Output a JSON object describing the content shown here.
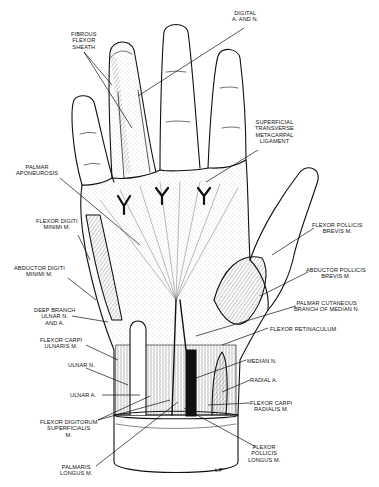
{
  "figure": {
    "signature": "k.P"
  },
  "labels": [
    {
      "id": "digital-a-and-n",
      "text": "DIGITAL\nA. AND N.",
      "x": 238,
      "y": 10,
      "align": "c"
    },
    {
      "id": "fibrous-flexor-sheath",
      "text": "FIBROUS\nFLEXOR\nSHEATH",
      "x": 70,
      "y": 31,
      "align": "c"
    },
    {
      "id": "superficial-transverse-metacarpal-ligament",
      "text": "SUPERFICIAL\nTRANSVERSE\nMETACARPAL\nLIGAMENT",
      "x": 256,
      "y": 119,
      "align": "c"
    },
    {
      "id": "palmar-aponeurosis",
      "text": "PALMAR\nAPONEUROSIS",
      "x": 16,
      "y": 164,
      "align": "c"
    },
    {
      "id": "flexor-digiti-minimi",
      "text": "FLEXOR DIGITI\nMINIMI M.",
      "x": 36,
      "y": 218,
      "align": "c"
    },
    {
      "id": "flexor-pollicis-brevis",
      "text": "FLEXOR POLLICIS\nBREVIS M.",
      "x": 314,
      "y": 222,
      "align": "c"
    },
    {
      "id": "abductor-digiti-minimi",
      "text": "ABDUCTOR DIGITI\nMINIMI M.",
      "x": 14,
      "y": 265,
      "align": "c"
    },
    {
      "id": "abductor-pollicis-brevis",
      "text": "ABDUCTOR POLLICIS\nBREVIS M.",
      "x": 306,
      "y": 267,
      "align": "c"
    },
    {
      "id": "deep-branch-ulnar",
      "text": "DEEP BRANCH\nULNAR N.\nAND A.",
      "x": 34,
      "y": 307,
      "align": "c"
    },
    {
      "id": "palmar-cutaneous-branch",
      "text": "PALMAR CUTANEOUS\nBRANCH OF MEDIAN N.",
      "x": 294,
      "y": 300,
      "align": "c"
    },
    {
      "id": "flexor-retinaculum",
      "text": "FLEXOR RETINACULUM",
      "x": 270,
      "y": 326,
      "align": "l"
    },
    {
      "id": "flexor-carpi-ulnaris",
      "text": "FLEXOR CARPI\nULNARIS M.",
      "x": 40,
      "y": 337,
      "align": "c"
    },
    {
      "id": "median-n",
      "text": "MEDIAN N.",
      "x": 247,
      "y": 358,
      "align": "l"
    },
    {
      "id": "ulnar-n",
      "text": "ULNAR N.",
      "x": 68,
      "y": 362,
      "align": "l"
    },
    {
      "id": "radial-a",
      "text": "RADIAL A.",
      "x": 250,
      "y": 377,
      "align": "l"
    },
    {
      "id": "ulnar-a",
      "text": "ULNAR A.",
      "x": 70,
      "y": 392,
      "align": "l"
    },
    {
      "id": "flexor-carpi-radialis",
      "text": "FLEXOR CARPI\nRADIALIS M.",
      "x": 250,
      "y": 400,
      "align": "c"
    },
    {
      "id": "flexor-digitorum-superficialis",
      "text": "FLEXOR DIGITORUM\nSUPERFICIALIS\nM.",
      "x": 40,
      "y": 419,
      "align": "c"
    },
    {
      "id": "flexor-pollicis-longus",
      "text": "FLEXOR\nPOLLICIS\nLONGUS M.",
      "x": 248,
      "y": 444,
      "align": "c"
    },
    {
      "id": "palmaris-longus",
      "text": "PALMARIS\nLONGUS M.",
      "x": 60,
      "y": 464,
      "align": "c"
    }
  ]
}
